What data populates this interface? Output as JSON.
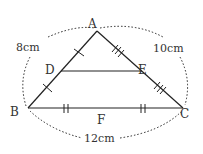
{
  "diagram": {
    "type": "geometry-triangle",
    "points": {
      "A": {
        "label": "A",
        "x": 97,
        "y": 31
      },
      "B": {
        "label": "B",
        "x": 28,
        "y": 108
      },
      "C": {
        "label": "C",
        "x": 183,
        "y": 108
      },
      "D": {
        "label": "D",
        "x": 61,
        "y": 71
      },
      "E": {
        "label": "E",
        "x": 142,
        "y": 71
      },
      "F": {
        "label": "F",
        "x": 101,
        "y": 108
      }
    },
    "lengths": {
      "AB": "8cm",
      "AC": "10cm",
      "BC": "12cm"
    },
    "segments": [
      "AB",
      "AC",
      "BC",
      "DE"
    ],
    "tick_marks": {
      "AD": 1,
      "DB": 1,
      "AE": 3,
      "EC": 3,
      "BF": 2,
      "FC": 2
    },
    "colors": {
      "stroke": "#222222",
      "text": "#333333",
      "background": "#ffffff"
    }
  }
}
